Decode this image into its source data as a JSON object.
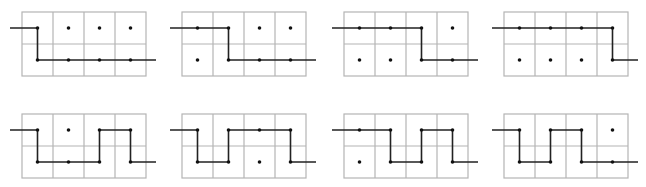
{
  "diagram": {
    "colors": {
      "grid": "#b4b4b4",
      "path": "#222222",
      "dot": "#111111",
      "background": "#ffffff"
    },
    "grid_size": {
      "rows": 2,
      "cols": 4,
      "cell_w": 31,
      "cell_h": 32
    },
    "panels": [
      {
        "id": 1,
        "origin": [
          22,
          12
        ],
        "path": [
          [
            0,
            0
          ],
          [
            0,
            1
          ],
          [
            1,
            1
          ],
          [
            2,
            1
          ],
          [
            3,
            1
          ]
        ]
      },
      {
        "id": 2,
        "origin": [
          182,
          12
        ],
        "path": [
          [
            0,
            0
          ],
          [
            1,
            0
          ],
          [
            1,
            1
          ],
          [
            2,
            1
          ],
          [
            3,
            1
          ]
        ]
      },
      {
        "id": 3,
        "origin": [
          344,
          12
        ],
        "path": [
          [
            0,
            0
          ],
          [
            1,
            0
          ],
          [
            2,
            0
          ],
          [
            2,
            1
          ],
          [
            3,
            1
          ]
        ]
      },
      {
        "id": 4,
        "origin": [
          504,
          12
        ],
        "path": [
          [
            0,
            0
          ],
          [
            1,
            0
          ],
          [
            2,
            0
          ],
          [
            3,
            0
          ],
          [
            3,
            1
          ]
        ]
      },
      {
        "id": 5,
        "origin": [
          22,
          114
        ],
        "path": [
          [
            0,
            0
          ],
          [
            0,
            1
          ],
          [
            1,
            1
          ],
          [
            2,
            1
          ],
          [
            2,
            0
          ],
          [
            3,
            0
          ],
          [
            3,
            1
          ]
        ]
      },
      {
        "id": 6,
        "origin": [
          182,
          114
        ],
        "path": [
          [
            0,
            0
          ],
          [
            0,
            1
          ],
          [
            1,
            1
          ],
          [
            1,
            0
          ],
          [
            2,
            0
          ],
          [
            3,
            0
          ],
          [
            3,
            1
          ]
        ]
      },
      {
        "id": 7,
        "origin": [
          344,
          114
        ],
        "path": [
          [
            0,
            0
          ],
          [
            1,
            0
          ],
          [
            1,
            1
          ],
          [
            2,
            1
          ],
          [
            2,
            0
          ],
          [
            3,
            0
          ],
          [
            3,
            1
          ]
        ]
      },
      {
        "id": 8,
        "origin": [
          504,
          114
        ],
        "path": [
          [
            0,
            0
          ],
          [
            0,
            1
          ],
          [
            1,
            1
          ],
          [
            1,
            0
          ],
          [
            2,
            0
          ],
          [
            2,
            1
          ],
          [
            3,
            1
          ]
        ]
      }
    ]
  }
}
